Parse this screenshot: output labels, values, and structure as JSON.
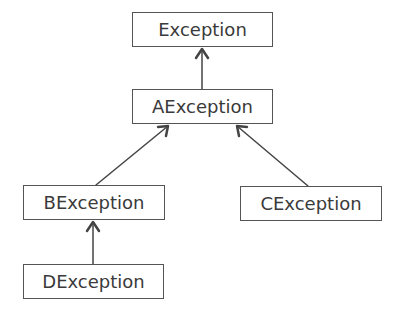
{
  "diagram": {
    "type": "class-hierarchy",
    "nodes": [
      {
        "id": "exception",
        "label": "Exception",
        "x": 132,
        "y": 12,
        "w": 141,
        "h": 35
      },
      {
        "id": "aexception",
        "label": "AException",
        "x": 132,
        "y": 89,
        "w": 141,
        "h": 35
      },
      {
        "id": "bexception",
        "label": "BException",
        "x": 23,
        "y": 185,
        "w": 142,
        "h": 35
      },
      {
        "id": "cexception",
        "label": "CException",
        "x": 240,
        "y": 186,
        "w": 142,
        "h": 35
      },
      {
        "id": "dexception",
        "label": "DException",
        "x": 23,
        "y": 264,
        "w": 141,
        "h": 35
      }
    ],
    "edges": [
      {
        "from": "aexception",
        "to": "exception",
        "relation": "extends"
      },
      {
        "from": "bexception",
        "to": "aexception",
        "relation": "extends"
      },
      {
        "from": "cexception",
        "to": "aexception",
        "relation": "extends"
      },
      {
        "from": "dexception",
        "to": "bexception",
        "relation": "extends"
      }
    ],
    "colors": {
      "stroke": "#555555",
      "text": "#3a3a3a",
      "background": "#ffffff"
    }
  }
}
